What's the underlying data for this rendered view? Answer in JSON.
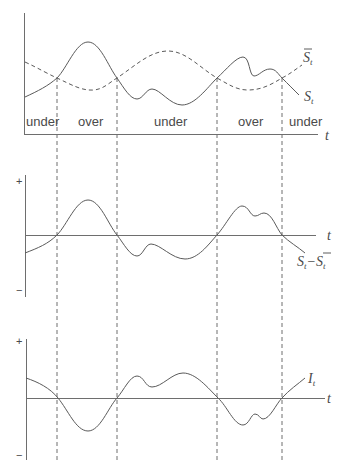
{
  "diagram": {
    "panel_top": {
      "curve_labels": {
        "price": "S",
        "price_sub": "t",
        "average": "S",
        "average_sub": "t"
      },
      "axis_label": "t",
      "regions": [
        "under",
        "over",
        "under",
        "over",
        "under"
      ]
    },
    "panel_middle": {
      "plus": "+",
      "minus": "−",
      "axis_label": "t",
      "curve_label": {
        "a": "S",
        "a_sub": "t",
        "op": "−",
        "b": "S",
        "b_sub": "t"
      }
    },
    "panel_bottom": {
      "plus": "+",
      "minus": "−",
      "axis_label": "t",
      "curve_label": "I",
      "curve_label_sub": "t"
    },
    "colors": {
      "line": "#5a5a5a",
      "axis": "#6e6e6e",
      "text": "#4a4a4a"
    }
  }
}
